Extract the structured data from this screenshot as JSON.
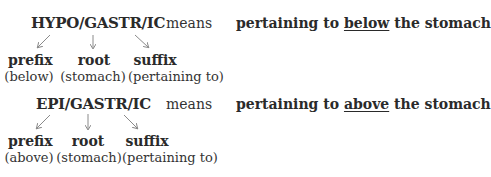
{
  "blocks": [
    {
      "term": "HYPO/GASTR/IC",
      "means": "means",
      "definition": {
        "before": "pertaining to ",
        "emphasis": "below",
        "after": " the stomach"
      },
      "parts": [
        {
          "role": "prefix",
          "meaning": "(below)"
        },
        {
          "role": "root",
          "meaning": "(stomach)"
        },
        {
          "role": "suffix",
          "meaning": "(pertaining to)"
        }
      ]
    },
    {
      "term": "EPI/GASTR/IC",
      "means": "means",
      "definition": {
        "before": "pertaining to ",
        "emphasis": "above",
        "after": " the stomach"
      },
      "parts": [
        {
          "role": "prefix",
          "meaning": "(above)"
        },
        {
          "role": "root",
          "meaning": "(stomach)"
        },
        {
          "role": "suffix",
          "meaning": "(pertaining to)"
        }
      ]
    }
  ],
  "colors": {
    "text": "#2a2a2a",
    "arrow": "#8a8a8a"
  }
}
